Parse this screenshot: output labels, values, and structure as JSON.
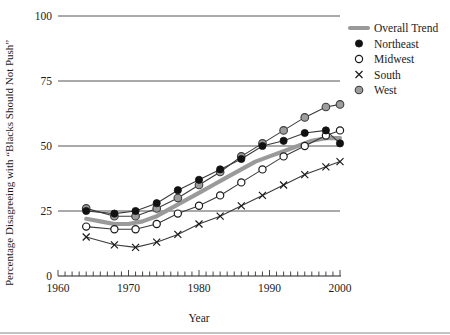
{
  "chart_data": {
    "type": "line",
    "title": "",
    "xlabel": "Year",
    "ylabel": "Percentage Disagreeing with “Blacks Should Not Push”",
    "xlim": [
      1960,
      2000
    ],
    "ylim": [
      0,
      100
    ],
    "xticks": [
      1960,
      1970,
      1980,
      1990,
      2000
    ],
    "yticks": [
      0,
      25,
      50,
      75,
      100
    ],
    "xtick_labels": [
      "1960",
      "1970",
      "1980",
      "1990",
      "2000"
    ],
    "ytick_labels": [
      "0",
      "25",
      "50",
      "75",
      "100"
    ],
    "grid": "horizontal",
    "minor_xticks_every": 1,
    "legend_position": "top-right",
    "series": [
      {
        "name": "Overall Trend",
        "marker": "thick-line",
        "color": "#9a9a9a",
        "x": [
          1964,
          1966,
          1968,
          1970,
          1972,
          1974,
          1976,
          1978,
          1980,
          1982,
          1984,
          1986,
          1988,
          1990,
          1992,
          1994,
          1996,
          1998,
          2000
        ],
        "y": [
          22,
          21,
          20,
          20,
          21,
          23,
          26,
          29,
          32,
          35,
          38,
          41,
          44,
          46,
          48,
          50,
          52,
          53,
          53
        ]
      },
      {
        "name": "Northeast",
        "marker": "filled-circle",
        "color": "#111111",
        "x": [
          1964,
          1968,
          1971,
          1974,
          1977,
          1980,
          1983,
          1986,
          1989,
          1992,
          1995,
          1998,
          2000
        ],
        "y": [
          25,
          24,
          25,
          28,
          33,
          37,
          41,
          45,
          50,
          52,
          55,
          56,
          51
        ]
      },
      {
        "name": "Midwest",
        "marker": "open-circle",
        "color": "#1a1a1a",
        "x": [
          1964,
          1968,
          1971,
          1974,
          1977,
          1980,
          1983,
          1986,
          1989,
          1992,
          1995,
          1998,
          2000
        ],
        "y": [
          19,
          18,
          18,
          20,
          24,
          27,
          31,
          36,
          41,
          46,
          50,
          54,
          56
        ]
      },
      {
        "name": "South",
        "marker": "x",
        "color": "#1a1a1a",
        "x": [
          1964,
          1968,
          1971,
          1974,
          1977,
          1980,
          1983,
          1986,
          1989,
          1992,
          1995,
          1998,
          2000
        ],
        "y": [
          15,
          12,
          11,
          13,
          16,
          20,
          23,
          27,
          31,
          35,
          39,
          42,
          44
        ]
      },
      {
        "name": "West",
        "marker": "gray-circle",
        "color": "#9d9d9d",
        "x": [
          1964,
          1968,
          1971,
          1974,
          1977,
          1980,
          1983,
          1986,
          1989,
          1992,
          1995,
          1998,
          2000
        ],
        "y": [
          26,
          23,
          23,
          26,
          30,
          35,
          40,
          46,
          51,
          56,
          61,
          65,
          66
        ]
      }
    ]
  },
  "legend": {
    "items": [
      {
        "label": "Overall Trend",
        "marker": "thick-line"
      },
      {
        "label": "Northeast",
        "marker": "filled-circle"
      },
      {
        "label": "Midwest",
        "marker": "open-circle"
      },
      {
        "label": "South",
        "marker": "x"
      },
      {
        "label": "West",
        "marker": "gray-circle"
      }
    ]
  }
}
